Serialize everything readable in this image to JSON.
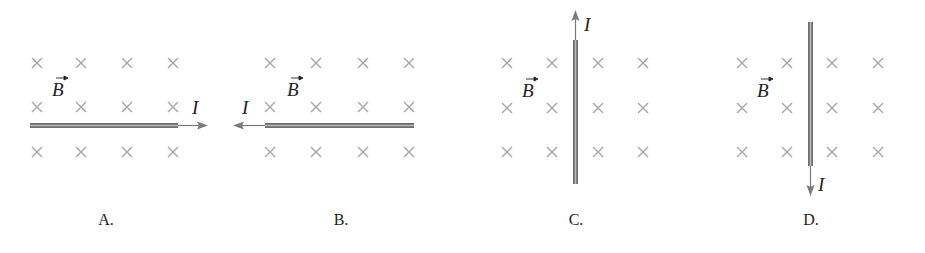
{
  "figure": {
    "field_symbol": "into-page-cross",
    "colors": {
      "cross": "#a8a8a8",
      "wire_edge": "#6e6e6e",
      "wire_core": "#b9b9b9",
      "text": "#222222"
    }
  },
  "panels": [
    {
      "caption": "A.",
      "field_label": "B",
      "current_label": "I",
      "wire_orientation": "horizontal",
      "current_direction": "right"
    },
    {
      "caption": "B.",
      "field_label": "B",
      "current_label": "I",
      "wire_orientation": "horizontal",
      "current_direction": "left"
    },
    {
      "caption": "C.",
      "field_label": "B",
      "current_label": "I",
      "wire_orientation": "vertical",
      "current_direction": "up"
    },
    {
      "caption": "D.",
      "field_label": "B",
      "current_label": "I",
      "wire_orientation": "vertical",
      "current_direction": "down"
    }
  ]
}
